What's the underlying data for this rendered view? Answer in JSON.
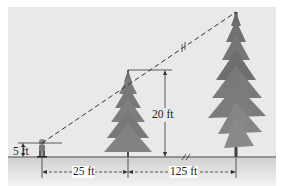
{
  "diagram": {
    "type": "similar-triangles-tree-height",
    "colors": {
      "sky": "#e9e9e9",
      "ground": "#d6d6d6",
      "ground_line": "#7a7a7a",
      "tree_dark": "#5a5a5a",
      "tree_mid": "#7e7e7e",
      "line": "#333333"
    },
    "labels": {
      "person_height": "5 ft",
      "small_tree_height": "20 ft",
      "distance_person_to_small_tree": "25 ft",
      "distance_small_tree_to_large_tree": "125 ft"
    }
  }
}
